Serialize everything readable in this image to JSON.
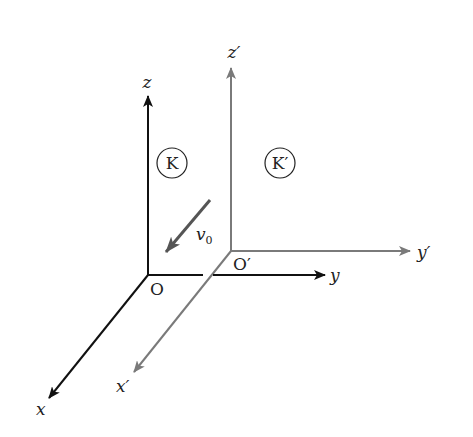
{
  "diagram": {
    "colors": {
      "frame_K": "#111111",
      "frame_K_prime": "#7a7a7a",
      "velocity_arrow": "#555555"
    },
    "frame_K": {
      "label": "K",
      "origin_label": "O",
      "axes": {
        "x": "x",
        "y": "y",
        "z": "z"
      }
    },
    "frame_K_prime": {
      "label": "K′",
      "origin_label": "O′",
      "axes": {
        "x": "x′",
        "y": "y′",
        "z": "z′"
      }
    },
    "velocity": {
      "symbol": "v",
      "subscript": "0"
    }
  }
}
